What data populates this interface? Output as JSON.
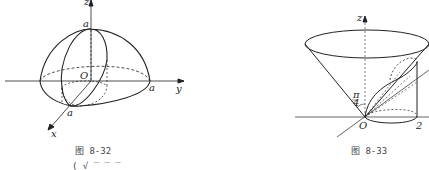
{
  "figures": [
    {
      "id": "fig-8-32",
      "caption": "图   8-32",
      "labels": {
        "z": "z",
        "y": "y",
        "x": "x",
        "origin": "O",
        "a_top": "a",
        "a_right": "a",
        "a_front": "a"
      }
    },
    {
      "id": "fig-8-33",
      "caption": "图   8-33",
      "labels": {
        "z": "z",
        "origin": "O",
        "angle": "π/4",
        "angle_num": "π",
        "angle_den": "4",
        "two": "2"
      }
    }
  ],
  "footer_fragment": "(    √ ‾ ‾ ‾"
}
